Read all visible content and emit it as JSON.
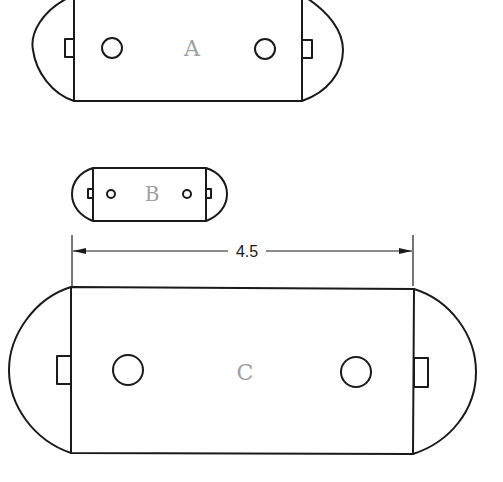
{
  "diagram": {
    "title": "",
    "shapes": [
      {
        "id": "A",
        "label": "A",
        "body": {
          "x1": 74,
          "x2": 302,
          "y1": -5,
          "y2": 101
        },
        "left_arc_extreme_x": 33,
        "right_arc_extreme_x": 343,
        "center_y": 48,
        "tabs": [
          {
            "x": 65,
            "y": 39,
            "w": 9,
            "h": 18
          },
          {
            "x": 302,
            "y": 40,
            "w": 10,
            "h": 18
          }
        ],
        "holes": [
          {
            "cx": 112,
            "cy": 48,
            "r": 10
          },
          {
            "cx": 265,
            "cy": 49,
            "r": 10
          }
        ],
        "label_pos": {
          "x": 192,
          "y": 56,
          "size": 22
        }
      },
      {
        "id": "B",
        "label": "B",
        "body": {
          "x1": 93,
          "x2": 206,
          "y1": 168,
          "y2": 221
        },
        "left_arc_extreme_x": 72,
        "right_arc_extreme_x": 227,
        "center_y": 194,
        "tabs": [
          {
            "x": 88,
            "y": 189,
            "w": 5,
            "h": 9
          },
          {
            "x": 206,
            "y": 189,
            "w": 5,
            "h": 9
          }
        ],
        "holes": [
          {
            "cx": 111,
            "cy": 194,
            "r": 4
          },
          {
            "cx": 187,
            "cy": 194,
            "r": 4
          }
        ],
        "label_pos": {
          "x": 152,
          "y": 201,
          "size": 20
        }
      },
      {
        "id": "C",
        "label": "C",
        "body": {
          "x1": 71,
          "x2": 414,
          "y1": 287,
          "y2": 454
        },
        "left_arc_extreme_x": 9,
        "right_arc_extreme_x": 476,
        "center_y": 370,
        "tabs": [
          {
            "x": 57,
            "y": 356,
            "w": 14,
            "h": 28
          },
          {
            "x": 414,
            "y": 358,
            "w": 14,
            "h": 29
          }
        ],
        "holes": [
          {
            "cx": 128,
            "cy": 370,
            "r": 15
          },
          {
            "cx": 356,
            "cy": 372,
            "r": 15
          }
        ],
        "label_pos": {
          "x": 245,
          "y": 380,
          "size": 22
        }
      }
    ],
    "dimension": {
      "value": "4.5",
      "x1": 72,
      "x2": 413,
      "y": 251,
      "ext_top": 235,
      "ext_bottom": 286,
      "text_x": 247,
      "gap_x1": 230,
      "gap_x2": 265
    },
    "colors": {
      "line": "#1a1a1a",
      "label": "#a0a0a0",
      "background": "#ffffff"
    }
  }
}
